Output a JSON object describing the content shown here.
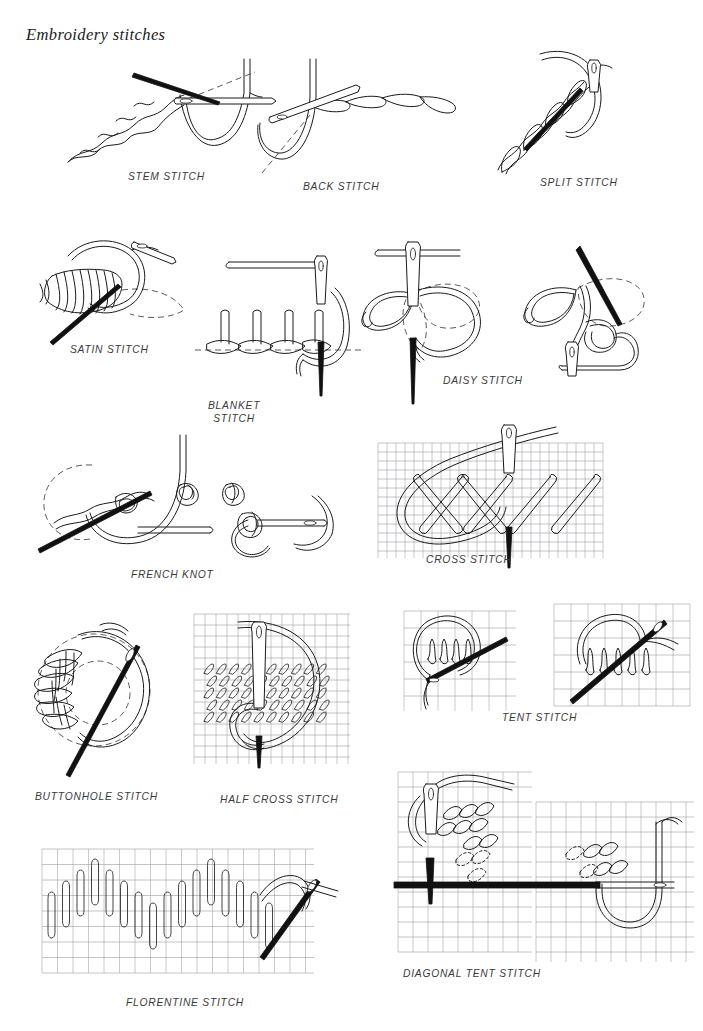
{
  "page": {
    "title": "Embroidery stitches",
    "width": 703,
    "height": 1031,
    "background": "#ffffff",
    "ink_color": "#1a1a1a",
    "label_color": "#3a3a3a",
    "grid_color": "#9aa0a6"
  },
  "figures": [
    {
      "id": "stem-stitch",
      "label": "STEM STITCH",
      "label_lines": [
        "STEM STITCH"
      ],
      "row": 1,
      "column": 1,
      "has_canvas_grid": false,
      "has_needle": true,
      "has_dashed_guide": true,
      "label_x": 128,
      "label_y": 170
    },
    {
      "id": "back-stitch",
      "label": "BACK STITCH",
      "label_lines": [
        "BACK STITCH"
      ],
      "row": 1,
      "column": 2,
      "has_canvas_grid": false,
      "has_needle": true,
      "has_dashed_guide": true,
      "label_x": 303,
      "label_y": 180
    },
    {
      "id": "split-stitch",
      "label": "SPLIT STITCH",
      "label_lines": [
        "SPLIT STITCH"
      ],
      "row": 1,
      "column": 3,
      "has_canvas_grid": false,
      "has_needle": true,
      "has_dashed_guide": false,
      "label_x": 540,
      "label_y": 176
    },
    {
      "id": "satin-stitch",
      "label": "SATIN STITCH",
      "label_lines": [
        "SATIN STITCH"
      ],
      "row": 2,
      "column": 1,
      "has_canvas_grid": false,
      "has_needle": true,
      "has_dashed_guide": true,
      "label_x": 70,
      "label_y": 343
    },
    {
      "id": "blanket-stitch",
      "label": "BLANKET STITCH",
      "label_lines": [
        "BLANKET",
        "STITCH"
      ],
      "row": 2,
      "column": 2,
      "has_canvas_grid": false,
      "has_needle": true,
      "has_dashed_guide": true,
      "label_x": 208,
      "label_y": 399
    },
    {
      "id": "daisy-stitch",
      "label": "DAISY STITCH",
      "label_lines": [
        "DAISY STITCH"
      ],
      "row": 2,
      "column": 3,
      "has_canvas_grid": false,
      "has_needle": true,
      "has_dashed_guide": true,
      "label_x": 443,
      "label_y": 374
    },
    {
      "id": "french-knot",
      "label": "FRENCH KNOT",
      "label_lines": [
        "FRENCH KNOT"
      ],
      "row": 3,
      "column": 1,
      "has_canvas_grid": false,
      "has_needle": true,
      "has_dashed_guide": true,
      "label_x": 131,
      "label_y": 568
    },
    {
      "id": "cross-stitch",
      "label": "CROSS STITCH",
      "label_lines": [
        "CROSS STITCH"
      ],
      "row": 3,
      "column": 2,
      "has_canvas_grid": true,
      "has_needle": true,
      "has_dashed_guide": false,
      "label_x": 426,
      "label_y": 553
    },
    {
      "id": "buttonhole-stitch",
      "label": "BUTTONHOLE STITCH",
      "label_lines": [
        "BUTTONHOLE STITCH"
      ],
      "row": 4,
      "column": 1,
      "has_canvas_grid": false,
      "has_needle": true,
      "has_dashed_guide": true,
      "label_x": 35,
      "label_y": 790
    },
    {
      "id": "half-cross-stitch",
      "label": "HALF CROSS STITCH",
      "label_lines": [
        "HALF CROSS STITCH"
      ],
      "row": 4,
      "column": 2,
      "has_canvas_grid": true,
      "has_needle": true,
      "has_dashed_guide": false,
      "label_x": 220,
      "label_y": 793
    },
    {
      "id": "tent-stitch",
      "label": "TENT STITCH",
      "label_lines": [
        "TENT STITCH"
      ],
      "row": 4,
      "column": 3,
      "has_canvas_grid": true,
      "has_needle": true,
      "has_dashed_guide": false,
      "label_x": 502,
      "label_y": 711
    },
    {
      "id": "florentine-stitch",
      "label": "FLORENTINE STITCH",
      "label_lines": [
        "FLORENTINE STITCH"
      ],
      "row": 5,
      "column": 1,
      "has_canvas_grid": true,
      "has_needle": true,
      "has_dashed_guide": false,
      "label_x": 126,
      "label_y": 996
    },
    {
      "id": "diagonal-tent-stitch",
      "label": "DIAGONAL TENT STITCH",
      "label_lines": [
        "DIAGONAL TENT STITCH"
      ],
      "row": 5,
      "column": 2,
      "has_canvas_grid": true,
      "has_needle": true,
      "has_dashed_guide": false,
      "label_x": 403,
      "label_y": 967
    }
  ]
}
